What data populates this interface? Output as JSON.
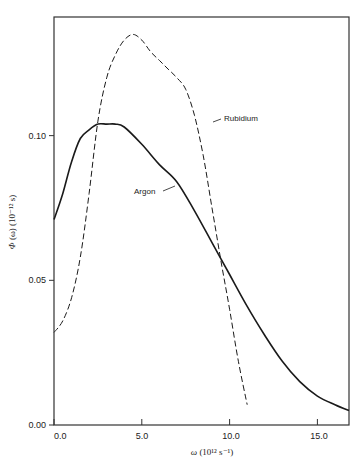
{
  "chart_data": {
    "type": "line",
    "title": "",
    "xlabel": "ω (10¹² s⁻¹)",
    "ylabel": "Φ (ω) (10⁻¹² s)",
    "xlim": [
      0,
      16.8
    ],
    "ylim": [
      0,
      0.141
    ],
    "grid": false,
    "x_ticks": [
      "0.0",
      "5.0",
      "10.0",
      "15.0"
    ],
    "y_ticks": [
      "0.00",
      "0.05",
      "0.10"
    ],
    "legend_position": "inline labels",
    "note": "Curve values are visual estimates (approx. ±3%), not measured from pixels.",
    "series": [
      {
        "name": "Argon",
        "style": "solid",
        "x": [
          0.0,
          0.5,
          1.0,
          1.5,
          2.0,
          2.5,
          3.0,
          3.5,
          4.0,
          5.0,
          6.0,
          7.0,
          8.0,
          9.0,
          10.0,
          11.0,
          12.0,
          13.0,
          14.0,
          15.0,
          16.0,
          16.8
        ],
        "y": [
          0.071,
          0.08,
          0.091,
          0.099,
          0.102,
          0.104,
          0.104,
          0.104,
          0.103,
          0.097,
          0.09,
          0.084,
          0.074,
          0.063,
          0.052,
          0.041,
          0.031,
          0.022,
          0.015,
          0.01,
          0.007,
          0.005
        ]
      },
      {
        "name": "Rubidium",
        "style": "dashed",
        "x": [
          0.0,
          0.5,
          1.0,
          1.5,
          2.0,
          2.5,
          3.0,
          3.5,
          4.0,
          4.5,
          5.0,
          5.5,
          6.0,
          6.5,
          7.0,
          7.5,
          8.0,
          8.5,
          9.0,
          9.5,
          10.0,
          10.5,
          11.0
        ],
        "y": [
          0.032,
          0.036,
          0.044,
          0.058,
          0.08,
          0.105,
          0.12,
          0.128,
          0.133,
          0.135,
          0.133,
          0.129,
          0.126,
          0.123,
          0.12,
          0.116,
          0.107,
          0.093,
          0.075,
          0.057,
          0.04,
          0.022,
          0.007
        ]
      }
    ],
    "annotations": [
      {
        "text": "Rubidium",
        "x": 9.5,
        "y": 0.1
      },
      {
        "text": "Argon",
        "x": 5.2,
        "y": 0.077
      }
    ]
  },
  "labels": {
    "y_axis_title_symbol": "Φ",
    "y_axis_title_rest": " (ω) (10⁻¹² s)",
    "x_axis_title_symbol": "ω",
    "x_axis_title_rest": " (10¹² s⁻¹)",
    "series_rubidium": "Rubidium",
    "series_argon": "Argon",
    "xtick_0": "0.0",
    "xtick_1": "5.0",
    "xtick_2": "10.0",
    "xtick_3": "15.0",
    "ytick_0": "0.00",
    "ytick_1": "0.05",
    "ytick_2": "0.10"
  },
  "colors": {
    "axis": "#333333",
    "line": "#1a1a1a",
    "background": "#ffffff"
  }
}
